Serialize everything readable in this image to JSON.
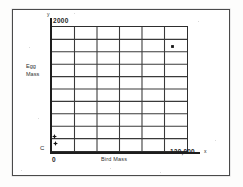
{
  "figure": {
    "frame": true,
    "background": "#ffffff",
    "ink_color": "#2e2e2e"
  },
  "axes": {
    "y_letter": "y",
    "x_letter": "x",
    "y_max_label": "2000",
    "x_max_label": "120,000",
    "origin_x_label": "0",
    "origin_y_label": "C",
    "y_title_line1": "Egg",
    "y_title_line2": "Mass",
    "x_title": "Bird Mass"
  },
  "chart_data": {
    "type": "scatter",
    "title": "",
    "subtitle": "",
    "xlabel": "Bird Mass",
    "ylabel": "Egg Mass",
    "xlim": [
      0,
      120000
    ],
    "ylim": [
      0,
      2000
    ],
    "xticks": [
      0,
      20000,
      40000,
      60000,
      80000,
      100000,
      120000
    ],
    "yticks": [
      0,
      200,
      400,
      600,
      800,
      1000,
      1200,
      1400,
      1600,
      1800,
      2000
    ],
    "xtick_labels": [
      "0",
      "",
      "",
      "",
      "",
      "",
      "120,000"
    ],
    "ytick_labels": [
      "C",
      "",
      "",
      "",
      "",
      "",
      "",
      "",
      "",
      "",
      "2000"
    ],
    "grid": true,
    "grid_columns": 6,
    "grid_rows": 10,
    "legend": null,
    "legend_position": "none",
    "series": [
      {
        "name": "data",
        "marker": "cross",
        "color": "#1d1d1d",
        "points": [
          {
            "x": 1500,
            "y": 180,
            "label": ""
          },
          {
            "x": 2500,
            "y": 60,
            "label": ""
          },
          {
            "x": 103000,
            "y": 1700,
            "label": ""
          }
        ]
      }
    ],
    "annotations": []
  },
  "markers": [
    {
      "name": "data-point-1",
      "left": 52.0,
      "top": 134.0
    },
    {
      "name": "data-point-2",
      "left": 53.0,
      "top": 141.0
    },
    {
      "name": "data-point-3",
      "left": 169.5,
      "top": 44.0
    }
  ]
}
